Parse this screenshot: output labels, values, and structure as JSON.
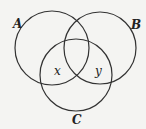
{
  "diagram": {
    "type": "venn",
    "sets": [
      {
        "label": "A",
        "cx": 52,
        "cy": 48,
        "r": 37
      },
      {
        "label": "B",
        "cx": 100,
        "cy": 48,
        "r": 36
      },
      {
        "label": "C",
        "cx": 76,
        "cy": 75,
        "r": 36
      }
    ],
    "region_labels": [
      {
        "text": "x",
        "region": "A∩C only"
      },
      {
        "text": "y",
        "region": "B∩C only"
      }
    ],
    "colors": {
      "stroke": "#333333",
      "background": "#f4f4f2"
    }
  }
}
